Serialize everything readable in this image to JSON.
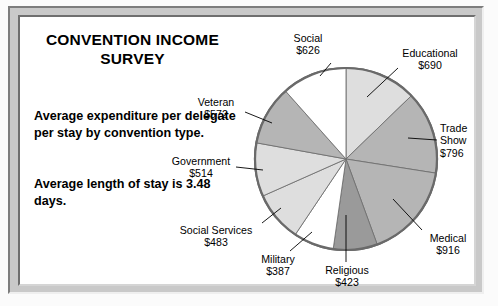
{
  "document": {
    "title_line1": "CONVENTION INCOME",
    "title_line2": "SURVEY",
    "paragraph1": "Average expenditure per delegate per stay by convention type.",
    "paragraph2": "Average length of stay is 3.48 days."
  },
  "chart_data": {
    "type": "pie",
    "title": "CONVENTION INCOME SURVEY",
    "subtitle": "Average expenditure per delegate per stay by convention type.",
    "note": "Average length of stay is 3.48 days.",
    "unit": "USD",
    "value_prefix": "$",
    "total": 5407,
    "start_angle_deg": 0,
    "direction": "clockwise",
    "legend": "none (direct labels with leader lines)",
    "categories": [
      "Educational",
      "Trade Show",
      "Medical",
      "Religious",
      "Military",
      "Social Services",
      "Government",
      "Veteran",
      "Social"
    ],
    "values": [
      690,
      796,
      916,
      423,
      387,
      483,
      514,
      572,
      626
    ],
    "slices": [
      {
        "label": "Educational",
        "value": 690,
        "value_text": "$690",
        "color": "#dedede",
        "percent": 12.8
      },
      {
        "label": "Trade Show",
        "value": 796,
        "value_text": "$796",
        "color": "#b5b5b5",
        "percent": 14.7
      },
      {
        "label": "Medical",
        "value": 916,
        "value_text": "$916",
        "color": "#b5b5b5",
        "percent": 16.9
      },
      {
        "label": "Religious",
        "value": 423,
        "value_text": "$423",
        "color": "#9a9a9a",
        "percent": 7.8
      },
      {
        "label": "Military",
        "value": 387,
        "value_text": "$387",
        "color": "#ffffff",
        "percent": 7.2
      },
      {
        "label": "Social Services",
        "value": 483,
        "value_text": "$483",
        "color": "#dedede",
        "percent": 8.9
      },
      {
        "label": "Government",
        "value": 514,
        "value_text": "$514",
        "color": "#dedede",
        "percent": 9.5
      },
      {
        "label": "Veteran",
        "value": 572,
        "value_text": "$572",
        "color": "#b5b5b5",
        "percent": 10.6
      },
      {
        "label": "Social",
        "value": 626,
        "value_text": "$626",
        "color": "#ffffff",
        "percent": 11.6
      }
    ],
    "labels": {
      "social": {
        "name": "Social",
        "amount": "$626"
      },
      "educational": {
        "name": "Educational",
        "amount": "$690"
      },
      "trade_show": {
        "name": "Trade",
        "name2": "Show",
        "amount": "$796"
      },
      "medical": {
        "name": "Medical",
        "amount": "$916"
      },
      "religious": {
        "name": "Religious",
        "amount": "$423"
      },
      "military": {
        "name": "Military",
        "amount": "$387"
      },
      "social_services": {
        "name": "Social Services",
        "amount": "$483"
      },
      "government": {
        "name": "Government",
        "amount": "$514"
      },
      "veteran": {
        "name": "Veteran",
        "amount": "$572"
      }
    },
    "geometry": {
      "center_x": 346,
      "center_y": 159,
      "radius": 91
    }
  }
}
